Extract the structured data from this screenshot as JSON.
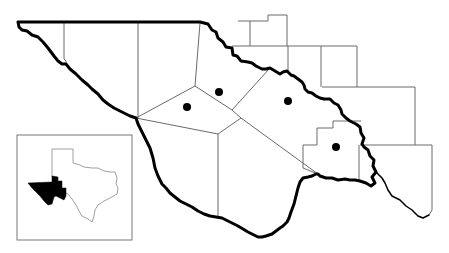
{
  "map": {
    "type": "regional county map with site locations",
    "region": "Trans-Pecos, West Texas",
    "colors": {
      "background": "#ffffff",
      "county_lines": "#6a6a6a",
      "study_area_boundary": "#000000",
      "site_markers": "#000000",
      "inset_highlight": "#000000"
    },
    "site_markers": [
      {
        "id": "site-1",
        "x": 187,
        "y": 107
      },
      {
        "id": "site-2",
        "x": 219,
        "y": 92
      },
      {
        "id": "site-3",
        "x": 288,
        "y": 101
      },
      {
        "id": "site-4",
        "x": 336,
        "y": 147
      }
    ],
    "inset": {
      "description": "Texas state outline with highlighted study region",
      "frame": {
        "x": 17,
        "y": 135,
        "width": 115,
        "height": 105
      }
    }
  }
}
